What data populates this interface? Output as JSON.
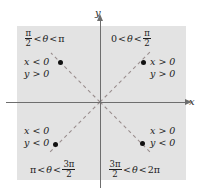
{
  "figure": {
    "colors": {
      "shade": "#e3e3e3",
      "axis": "#6e6e6e",
      "dashed": "#9a8e8e",
      "point": "#111111",
      "text": "#1c1c1c"
    },
    "axes": {
      "x_label": "x",
      "y_label": "y"
    },
    "quadrants": [
      {
        "id": "quadrant-2",
        "angle_range": {
          "lower": "π/2",
          "relation_1": "<",
          "variable": "θ",
          "relation_2": "<",
          "upper": "π"
        },
        "angle_lower_num": "π",
        "angle_lower_den": "2",
        "angle_upper_plain": "π",
        "sign_x": "x < 0",
        "sign_y": "y > 0"
      },
      {
        "id": "quadrant-1",
        "angle_range": {
          "lower": "0",
          "relation_1": "<",
          "variable": "θ",
          "relation_2": "<",
          "upper": "π/2"
        },
        "angle_lower_plain": "0",
        "angle_upper_num": "π",
        "angle_upper_den": "2",
        "sign_x": "x > 0",
        "sign_y": "y > 0"
      },
      {
        "id": "quadrant-3",
        "angle_range": {
          "lower": "π",
          "relation_1": "<",
          "variable": "θ",
          "relation_2": "<",
          "upper": "3π/2"
        },
        "angle_lower_plain": "π",
        "angle_upper_num": "3π",
        "angle_upper_den": "2",
        "sign_x": "x < 0",
        "sign_y": "y < 0"
      },
      {
        "id": "quadrant-4",
        "angle_range": {
          "lower": "3π/2",
          "relation_1": "<",
          "variable": "θ",
          "relation_2": "<",
          "upper": "2π"
        },
        "angle_lower_num": "3π",
        "angle_lower_den": "2",
        "angle_upper_plain": "2π",
        "sign_x": "x > 0",
        "sign_y": "y < 0"
      }
    ],
    "symbols": {
      "theta": "θ",
      "lt": "<",
      "pi": "π"
    },
    "points": [
      {
        "name": "point-quadrant-2",
        "x": 60,
        "y": 62
      },
      {
        "name": "point-quadrant-1",
        "x": 143,
        "y": 62
      },
      {
        "name": "point-quadrant-3",
        "x": 55,
        "y": 144
      },
      {
        "name": "point-quadrant-4",
        "x": 142,
        "y": 143
      }
    ]
  }
}
